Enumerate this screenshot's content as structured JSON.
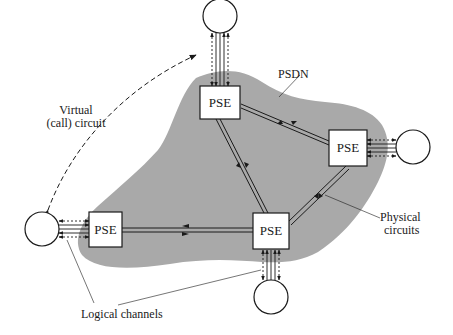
{
  "diagram": {
    "cloud_label": "PSDN",
    "switch_label": "PSE",
    "labels": {
      "virtual_circuit_line1": "Virtual",
      "virtual_circuit_line2": "(call) circuit",
      "physical_circuits_line1": "Physical",
      "physical_circuits_line2": "circuits",
      "logical_channels": "Logical channels"
    },
    "nodes": [
      {
        "id": "pse-top",
        "type": "PSE",
        "label": "PSE"
      },
      {
        "id": "pse-right",
        "type": "PSE",
        "label": "PSE"
      },
      {
        "id": "pse-left",
        "type": "PSE",
        "label": "PSE"
      },
      {
        "id": "pse-bottom",
        "type": "PSE",
        "label": "PSE"
      },
      {
        "id": "dte-top",
        "type": "DTE"
      },
      {
        "id": "dte-right",
        "type": "DTE"
      },
      {
        "id": "dte-left",
        "type": "DTE"
      },
      {
        "id": "dte-bottom",
        "type": "DTE"
      }
    ],
    "edges": [
      {
        "from": "pse-top",
        "to": "pse-right",
        "kind": "physical-circuit"
      },
      {
        "from": "pse-top",
        "to": "pse-bottom",
        "kind": "physical-circuit"
      },
      {
        "from": "pse-right",
        "to": "pse-bottom",
        "kind": "physical-circuit"
      },
      {
        "from": "pse-left",
        "to": "pse-bottom",
        "kind": "physical-circuit"
      },
      {
        "from": "dte-top",
        "to": "pse-top",
        "kind": "logical-channels"
      },
      {
        "from": "dte-right",
        "to": "pse-right",
        "kind": "logical-channels"
      },
      {
        "from": "dte-left",
        "to": "pse-left",
        "kind": "logical-channels"
      },
      {
        "from": "dte-bottom",
        "to": "pse-bottom",
        "kind": "logical-channels"
      },
      {
        "from": "dte-left",
        "to": "dte-top",
        "kind": "virtual-call-circuit"
      }
    ],
    "colors": {
      "cloud_fill": "#a9a9a9",
      "line": "#1a1a1a",
      "box_fill": "#ffffff",
      "background": "#ffffff"
    }
  }
}
